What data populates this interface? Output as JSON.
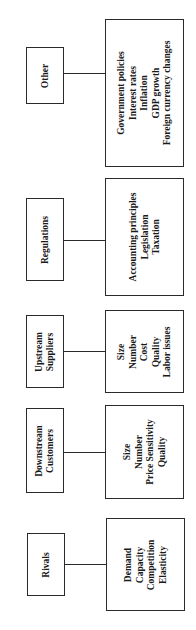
{
  "diagram": {
    "groups": [
      {
        "category": [
          "Other"
        ],
        "details": [
          "Government policies",
          "Interest rates",
          "Inflation",
          "GDP growth",
          "Foreign currency changes"
        ]
      },
      {
        "category": [
          "Regulations"
        ],
        "details": [
          "Accounting principles",
          "Legislation",
          "Taxation"
        ]
      },
      {
        "category": [
          "Upstream",
          "Suppliers"
        ],
        "details": [
          "Size",
          "Number",
          "Cost",
          "Quality",
          "Labor issues"
        ]
      },
      {
        "category": [
          "Downstream",
          "Customers"
        ],
        "details": [
          "Size",
          "Number",
          "Price Sensitivity",
          "Quality"
        ]
      },
      {
        "category": [
          "Rivals"
        ],
        "details": [
          "Demand",
          "Capacity",
          "Competition",
          "Elasticity"
        ]
      }
    ]
  }
}
